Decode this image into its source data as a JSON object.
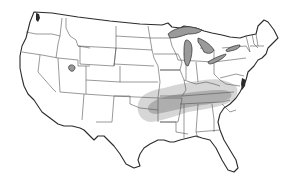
{
  "figure": {
    "title_faint": "",
    "background": "#ffffff",
    "outline_color": "#2b2b2b",
    "state_border_color": "#555555",
    "lake_color": "#9a9a9a"
  },
  "map": {
    "regions_shaded": [
      {
        "name": "outer-zone",
        "description": "Light grey band spanning eastern Oklahoma, Arkansas, southern Missouri, Kentucky, Tennessee, northern Mississippi/Alabama/Georgia and western North Carolina",
        "color": "#c8c8c8"
      },
      {
        "name": "inner-zone",
        "description": "Darker grey core band along Arkansas, Tennessee and the Kentucky/Tennessee border toward North Carolina",
        "color": "#9c9c9c"
      }
    ],
    "water_bodies": [
      "Lake Superior",
      "Lake Michigan",
      "Lake Huron",
      "Lake Erie",
      "Lake Ontario",
      "Great Salt Lake",
      "Puget Sound"
    ]
  }
}
